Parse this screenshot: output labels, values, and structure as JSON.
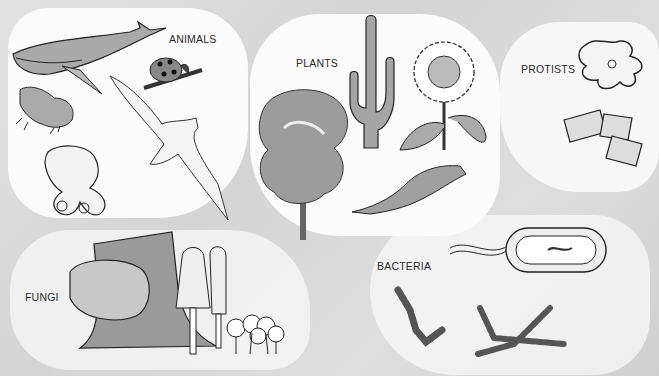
{
  "diagram": {
    "groups": [
      {
        "id": "animals",
        "label": "ANIMALS",
        "organisms": [
          "whale",
          "ladybug",
          "frog",
          "albatross",
          "octopus"
        ]
      },
      {
        "id": "plants",
        "label": "PLANTS",
        "organisms": [
          "tree",
          "saguaro cactus",
          "sunflower",
          "liverwort/moss"
        ]
      },
      {
        "id": "protists",
        "label": "PROTISTS",
        "organisms": [
          "amoeba",
          "diatoms"
        ]
      },
      {
        "id": "fungi",
        "label": "FUNGI",
        "organisms": [
          "bracket fungus on stump",
          "shaggy mane mushrooms",
          "small mushroom cluster"
        ]
      },
      {
        "id": "bacteria",
        "label": "BACTERIA",
        "organisms": [
          "flagellated rod bacterium",
          "streptococcus chain",
          "filamentous bacteria"
        ]
      }
    ]
  },
  "colors": {
    "background": "#d9d9d9",
    "region": "#fbfbfb",
    "ink": "#222222",
    "shade": "#9a9a9a"
  }
}
